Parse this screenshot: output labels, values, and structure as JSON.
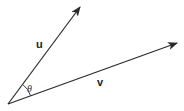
{
  "diagram": {
    "title": "",
    "colors": {
      "stroke": "#2a2a2a",
      "text": "#222222",
      "background": "#ffffff"
    },
    "origin": {
      "x": 8,
      "y": 104
    },
    "vectors": [
      {
        "id": "u",
        "label": "u",
        "tip": {
          "x": 80,
          "y": 7
        },
        "label_pos": {
          "x": 36,
          "y": 48
        }
      },
      {
        "id": "v",
        "label": "v",
        "tip": {
          "x": 177,
          "y": 43
        },
        "label_pos": {
          "x": 97,
          "y": 86
        }
      }
    ],
    "angle": {
      "label": "θ",
      "label_pos": {
        "x": 27,
        "y": 92
      }
    }
  }
}
